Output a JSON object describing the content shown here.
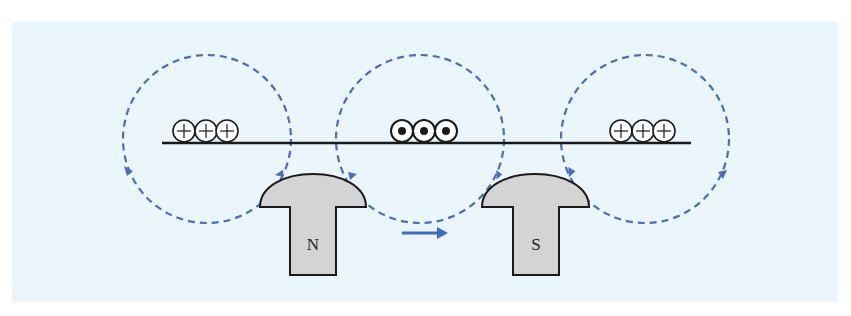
{
  "diagram": {
    "colors": {
      "background_panel": "#eaf5fc",
      "field_lines": "#4a6fb8",
      "arrow": "#3b6cc4",
      "magnet_fill": "#d4d4d4",
      "outline": "#1a1a1a"
    },
    "conductor": {
      "label": "conducting-strip"
    },
    "current_groups": [
      {
        "position": "left",
        "symbol": "⊕",
        "meaning": "current into page",
        "count": 3
      },
      {
        "position": "center",
        "symbol": "⊙",
        "meaning": "current out of page",
        "count": 3
      },
      {
        "position": "right",
        "symbol": "⊕",
        "meaning": "current into page",
        "count": 3
      }
    ],
    "field_loops": [
      {
        "position": "left",
        "style": "dashed"
      },
      {
        "position": "center",
        "style": "dashed"
      },
      {
        "position": "right",
        "style": "dashed"
      }
    ],
    "magnets": [
      {
        "pole": "N"
      },
      {
        "pole": "S"
      }
    ],
    "motion_arrow": {
      "direction": "right"
    }
  }
}
